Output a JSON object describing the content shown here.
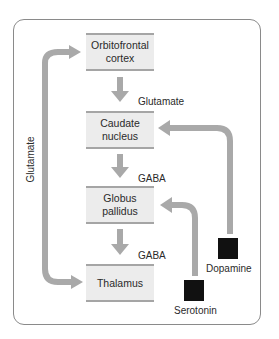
{
  "diagram": {
    "nodes": [
      {
        "id": "orbitofrontal",
        "label": "Orbitofrontal cortex"
      },
      {
        "id": "caudate",
        "label": "Caudate nucleus"
      },
      {
        "id": "globus",
        "label": "Globus pallidus"
      },
      {
        "id": "thalamus",
        "label": "Thalamus"
      }
    ],
    "node_lines": {
      "orbitofrontal": [
        "Orbitofrontal",
        "cortex"
      ],
      "caudate": [
        "Caudate",
        "nucleus"
      ],
      "globus": [
        "Globus",
        "pallidus"
      ],
      "thalamus": [
        "Thalamus"
      ]
    },
    "edge_labels": {
      "orbitofrontal_to_caudate": "Glutamate",
      "caudate_to_globus": "GABA",
      "globus_to_thalamus": "GABA",
      "thalamus_to_orbitofrontal": "Glutamate"
    },
    "modulators": {
      "dopamine": "Dopamine",
      "serotonin": "Serotonin"
    },
    "edges": [
      {
        "from": "orbitofrontal",
        "to": "caudate",
        "label": "Glutamate"
      },
      {
        "from": "caudate",
        "to": "globus",
        "label": "GABA"
      },
      {
        "from": "globus",
        "to": "thalamus",
        "label": "GABA"
      },
      {
        "from": "thalamus",
        "to": "orbitofrontal",
        "label": "Glutamate"
      },
      {
        "from": "dopamine",
        "to": "caudate",
        "label": ""
      },
      {
        "from": "serotonin",
        "to": "globus",
        "label": ""
      }
    ],
    "colors": {
      "arrow": "#a9a9a9",
      "box_fill": "#ececec",
      "box_rule": "#a5a5a5",
      "modulator": "#111111",
      "frame": "#8a8a8a"
    }
  }
}
